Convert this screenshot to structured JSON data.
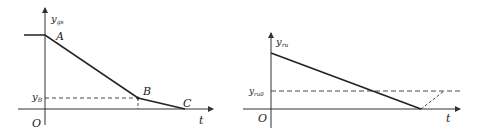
{
  "left_chart": {
    "y_axis_label": "y",
    "y_axis_sub": "gs",
    "x_axis_label": "t",
    "origin_label": "O",
    "points": [
      {
        "name": "A",
        "label": "A"
      },
      {
        "name": "B",
        "label": "B"
      },
      {
        "name": "C",
        "label": "C"
      }
    ],
    "level_label": "y",
    "level_sub": "B"
  },
  "right_chart": {
    "y_axis_label": "y",
    "y_axis_sub": "ru",
    "x_axis_label": "t",
    "origin_label": "O",
    "level_label": "y",
    "level_sub": "ru0"
  },
  "colors": {
    "line": "#222222",
    "axis": "#333333",
    "background": "#ffffff"
  }
}
